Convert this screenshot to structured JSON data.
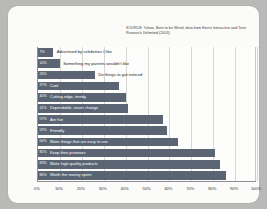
{
  "card": {
    "title": ""
  },
  "source_note": "SOURCE: Yahoo, Born to be Wired, data from Harris Interactive and Teen Research Unlimited (2003)",
  "chart_data": {
    "type": "bar",
    "orientation": "horizontal",
    "title": "",
    "subtitle": "",
    "xlabel": "",
    "ylabel": "",
    "xlim": [
      0,
      100
    ],
    "grid": true,
    "legend": "none",
    "xticks": [
      "0%",
      "10%",
      "20%",
      "30%",
      "40%",
      "50%",
      "60%",
      "70%",
      "80%",
      "90%",
      "100%"
    ],
    "xtick_values": [
      0,
      10,
      20,
      30,
      40,
      50,
      60,
      70,
      80,
      90,
      100
    ],
    "bar_color": "#5a6472",
    "categories": [
      "Advertised by celebrities I like",
      "Something my parents wouldn't like",
      "Do things to get noticed",
      "Cool",
      "Cutting edge, trendy",
      "Dependable, never change",
      "Are fun",
      "Friendly",
      "Make things that are easy to use",
      "Keep their promises",
      "Make high quality products",
      "Worth the money spent"
    ],
    "values": [
      7,
      10,
      26,
      37,
      40,
      41,
      57,
      59,
      64,
      81,
      83,
      86
    ],
    "value_labels": [
      "7%",
      "10%",
      "26%",
      "37%",
      "40%",
      "41%",
      "57%",
      "59%",
      "64%",
      "81%",
      "83%",
      "86%"
    ],
    "label_placement": [
      "outside",
      "outside",
      "outside",
      "inside",
      "inside",
      "inside",
      "inside",
      "inside",
      "inside",
      "inside",
      "inside",
      "inside"
    ]
  }
}
